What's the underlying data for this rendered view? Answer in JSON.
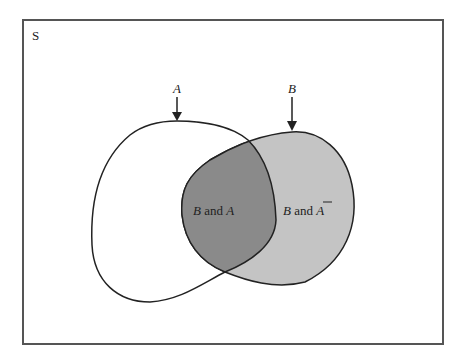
{
  "diagram": {
    "type": "venn",
    "universe_label": "S",
    "sets": [
      {
        "name": "A",
        "label": "A",
        "fill": "#ffffff"
      },
      {
        "name": "B",
        "label": "B",
        "fill": "#c4c4c4"
      }
    ],
    "regions": [
      {
        "id": "b-and-a",
        "text_var1": "B",
        "text_and": "and",
        "text_var2": "A",
        "fill": "#8a8a8a"
      },
      {
        "id": "b-and-not-a",
        "text_var1": "B",
        "text_and": "and",
        "text_var2": "A",
        "complement": true,
        "fill": "#c4c4c4"
      }
    ],
    "colors": {
      "border": "#555555",
      "outline": "#222222"
    }
  }
}
